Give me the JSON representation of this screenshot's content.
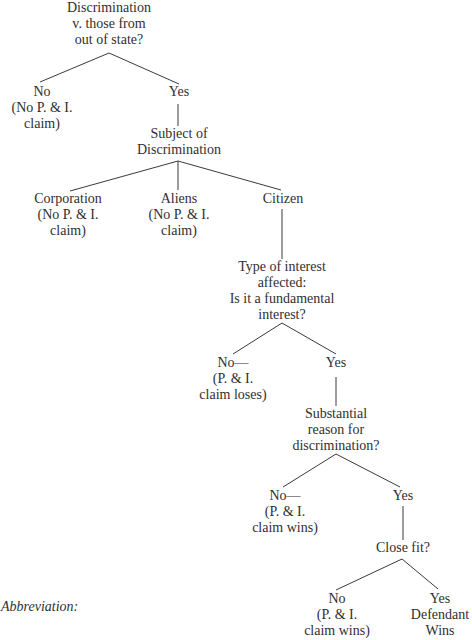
{
  "diagram": {
    "type": "decision-tree",
    "stroke_color": "#3a3a3a",
    "text_color": "#2f2f2f",
    "nodes": {
      "root": {
        "lines": [
          "Discrimination",
          "v. those from",
          "out of state?"
        ]
      },
      "root_no": {
        "lines": [
          "No",
          "(No P. & I.",
          "claim)"
        ]
      },
      "root_yes": {
        "lines": [
          "Yes"
        ]
      },
      "subject": {
        "lines": [
          "Subject of",
          "Discrimination"
        ]
      },
      "corporation": {
        "lines": [
          "Corporation",
          "(No P. & I.",
          "claim)"
        ]
      },
      "aliens": {
        "lines": [
          "Aliens",
          "(No P. & I.",
          "claim)"
        ]
      },
      "citizen": {
        "lines": [
          "Citizen"
        ]
      },
      "interest": {
        "lines": [
          "Type of interest",
          "affected:",
          "Is it a fundamental",
          "interest?"
        ]
      },
      "interest_no": {
        "lines": [
          "No—",
          "(P. & I.",
          "claim loses)"
        ]
      },
      "interest_yes": {
        "lines": [
          "Yes"
        ]
      },
      "substantial": {
        "lines": [
          "Substantial",
          "reason for",
          "discrimination?"
        ]
      },
      "substantial_no": {
        "lines": [
          "No—",
          "(P. & I.",
          "claim wins)"
        ]
      },
      "substantial_yes": {
        "lines": [
          "Yes"
        ]
      },
      "closefit": {
        "lines": [
          "Close fit?"
        ]
      },
      "closefit_no": {
        "lines": [
          "No",
          "(P. & I.",
          "claim wins)"
        ]
      },
      "closefit_yes": {
        "lines": [
          "Yes",
          "Defendant",
          "Wins"
        ]
      }
    },
    "abbreviation_label": "Abbreviation:"
  }
}
